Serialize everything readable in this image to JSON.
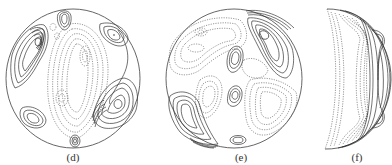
{
  "figure": {
    "panels": [
      {
        "id": "d",
        "label": "(d)",
        "shape": "circle",
        "description": "contour plot on a disk; solid = positive, dashed = negative"
      },
      {
        "id": "e",
        "label": "(e)",
        "shape": "circle",
        "description": "contour plot on a disk; solid = positive, dashed = negative"
      },
      {
        "id": "f",
        "label": "(f)",
        "shape": "crescent",
        "description": "contour plot on a crescent-shaped (side) section"
      }
    ],
    "colors": {
      "background": "#ffffff",
      "outline": "#555555",
      "solid_contour": "#333333",
      "dashed_contour": "#555555"
    }
  }
}
